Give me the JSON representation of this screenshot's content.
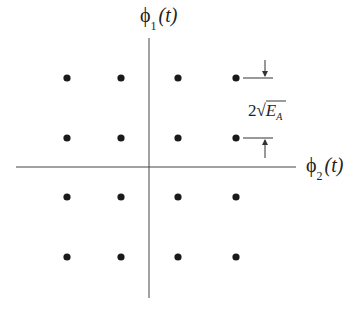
{
  "diagram": {
    "type": "signal-constellation",
    "vertical_axis_label": {
      "main": "ϕ",
      "sub": "1",
      "arg": "(t)"
    },
    "horizontal_axis_label": {
      "main": "ϕ",
      "sub": "2",
      "arg": "(t)"
    },
    "spacing_annotation": {
      "coef": "2",
      "radical": "√",
      "var": "E",
      "sub": "A"
    },
    "point_color": "#1a1a1a",
    "points_x": [
      67,
      121,
      178,
      236
    ],
    "points_y": [
      78,
      138,
      197,
      257
    ]
  }
}
